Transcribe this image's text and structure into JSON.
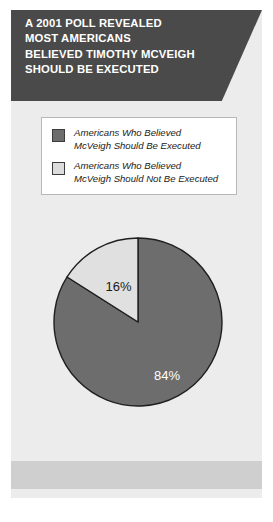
{
  "header": {
    "lines": [
      "A 2001 POLL REVEALED",
      "MOST AMERICANS",
      "BELIEVED TIMOTHY MCVEIGH",
      "SHOULD BE EXECUTED"
    ],
    "line1": "A 2001 POLL REVEALED",
    "line2": "MOST AMERICANS",
    "line3": "BELIEVED TIMOTHY MCVEIGH",
    "line4": "SHOULD BE EXECUTED",
    "background_color": "#4a4a4a",
    "text_color": "#ffffff"
  },
  "legend": {
    "items": [
      {
        "label": "Americans Who Believed\nMcVeigh Should Be Executed",
        "color": "#6d6d6d",
        "swatch_name": "legend-swatch-executed"
      },
      {
        "label": "Americans Who Believed\nMcVeigh Should Not Be Executed",
        "color": "#dcdcdc",
        "swatch_name": "legend-swatch-not-executed"
      }
    ]
  },
  "chart_data": {
    "type": "pie",
    "title": "A 2001 POLL REVEALED MOST AMERICANS BELIEVED TIMOTHY MCVEIGH SHOULD BE EXECUTED",
    "categories": [
      "Americans Who Believed McVeigh Should Be Executed",
      "Americans Who Believed McVeigh Should Not Be Executed"
    ],
    "values": [
      84,
      16
    ],
    "value_labels": [
      "84%",
      "16%"
    ],
    "colors": [
      "#6d6d6d",
      "#e0e0e0"
    ],
    "label_colors": [
      "#ffffff",
      "#1b1b1b"
    ],
    "units": "percent",
    "start_angle_deg": 0,
    "direction": "clockwise",
    "legend_position": "top",
    "grid": false,
    "xlabel": "",
    "ylabel": ""
  },
  "footer": {
    "source": "Taken from: Gallup News Service, May 2, 2001, www.gallup.com.",
    "background_color": "#cfcfcf"
  },
  "card": {
    "background_color": "#ececec"
  }
}
